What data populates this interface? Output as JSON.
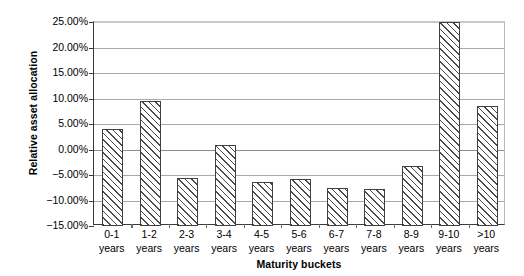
{
  "chart_data": {
    "type": "bar",
    "title": "",
    "xlabel": "Maturity buckets",
    "ylabel": "Relative asset allocation",
    "categories": [
      "0-1 years",
      "1-2 years",
      "2-3 years",
      "3-4 years",
      "4-5 years",
      "5-6 years",
      "6-7 years",
      "7-8 years",
      "8-9 years",
      "9-10 years",
      ">10 years"
    ],
    "category_lines": [
      [
        "0-1",
        "years"
      ],
      [
        "1-2",
        "years"
      ],
      [
        "2-3",
        "years"
      ],
      [
        "3-4",
        "years"
      ],
      [
        "4-5",
        "years"
      ],
      [
        "5-6",
        "years"
      ],
      [
        "6-7",
        "years"
      ],
      [
        "7-8",
        "years"
      ],
      [
        "8-9",
        "years"
      ],
      [
        "9-10",
        "years"
      ],
      [
        ">10",
        "years"
      ]
    ],
    "values": [
      4.0,
      9.5,
      -5.6,
      0.9,
      -6.4,
      -5.7,
      -7.6,
      -7.7,
      -3.2,
      25.1,
      8.5
    ],
    "value_labels": [
      "4.00%",
      "9.50%",
      "-5.60%",
      "0.90%",
      "-6.40%",
      "-5.70%",
      "-7.60%",
      "-7.70%",
      "-3.20%",
      "25.10%",
      "8.50%"
    ],
    "ylim": [
      -15,
      25
    ],
    "ytick_values": [
      25,
      20,
      15,
      10,
      5,
      0,
      -5,
      -10,
      -15
    ],
    "ytick_labels": [
      "25.00%",
      "20.00%",
      "15.00%",
      "10.00%",
      "5.00%",
      "0.00%",
      "-5.00%",
      "-10.00%",
      "-15.00%"
    ],
    "grid": true,
    "grid_axis": "y",
    "legend": false,
    "bar_fill": "diagonal-hatch",
    "bar_edge_color": "#3f3f3f",
    "bar_face_color": "#ffffff",
    "axis_color": "#3a3a3a",
    "gridline_color": "#a8a8a8",
    "background_color": "#ffffff"
  }
}
